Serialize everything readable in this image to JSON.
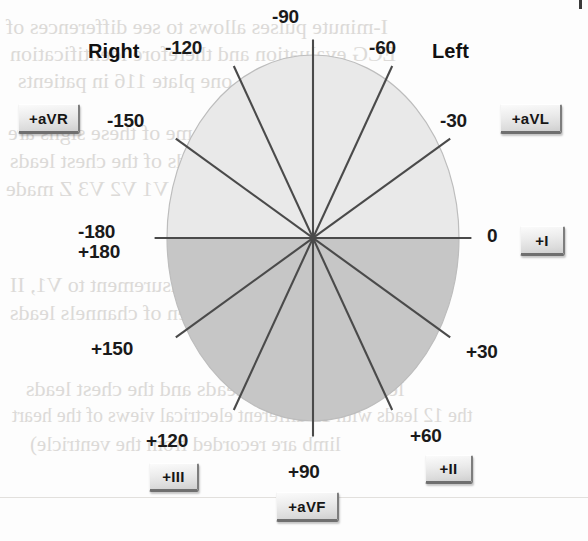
{
  "diagram": {
    "title_semantic": "hexaxial-reference-system",
    "center": {
      "x": 313,
      "y": 238
    },
    "radius_x": 146,
    "radius_y": 183,
    "colors": {
      "upper_half_fill": "#e9e9e9",
      "lower_half_fill": "#c6c6c6",
      "axis_line": "#4a4a4a",
      "circle_edge": "#bdbdbd",
      "label_text": "#1a1a1a",
      "button_face": "#e8e8e8",
      "page_background": "#fdfdfd"
    },
    "headings": {
      "right": "Right",
      "left": "Left"
    },
    "degree_labels": [
      {
        "name": "minus-90",
        "text": "-90",
        "x": 272,
        "y": 6,
        "angle": -90
      },
      {
        "name": "minus-60",
        "text": "-60",
        "x": 369,
        "y": 37,
        "angle": -60
      },
      {
        "name": "minus-30",
        "text": "-30",
        "x": 440,
        "y": 110,
        "angle": -30
      },
      {
        "name": "zero",
        "text": "0",
        "x": 487,
        "y": 225,
        "angle": 0
      },
      {
        "name": "plus-30",
        "text": "+30",
        "x": 466,
        "y": 341,
        "angle": 30
      },
      {
        "name": "plus-60",
        "text": "+60",
        "x": 410,
        "y": 425,
        "angle": 60
      },
      {
        "name": "plus-90",
        "text": "+90",
        "x": 288,
        "y": 461,
        "angle": 90
      },
      {
        "name": "plus-120",
        "text": "+120",
        "x": 146,
        "y": 430,
        "angle": 120
      },
      {
        "name": "plus-150",
        "text": "+150",
        "x": 91,
        "y": 338,
        "angle": 150
      },
      {
        "name": "plus-minus-180-line1",
        "text": "-180",
        "x": 78,
        "y": 221,
        "angle": 180
      },
      {
        "name": "plus-minus-180-line2",
        "text": "+180",
        "x": 78,
        "y": 241,
        "angle": 180
      },
      {
        "name": "minus-150",
        "text": "-150",
        "x": 107,
        "y": 110,
        "angle": -150
      },
      {
        "name": "minus-120",
        "text": "-120",
        "x": 165,
        "y": 37,
        "angle": -120
      }
    ],
    "lead_buttons": [
      {
        "name": "lead-aVR",
        "label": "+aVR",
        "x": 18,
        "y": 104,
        "w": 62,
        "h": 30
      },
      {
        "name": "lead-aVL",
        "label": "+aVL",
        "x": 500,
        "y": 104,
        "w": 62,
        "h": 30
      },
      {
        "name": "lead-I",
        "label": "+I",
        "x": 520,
        "y": 226,
        "w": 45,
        "h": 30
      },
      {
        "name": "lead-II",
        "label": "+II",
        "x": 425,
        "y": 455,
        "w": 48,
        "h": 29
      },
      {
        "name": "lead-aVF",
        "label": "+aVF",
        "x": 276,
        "y": 492,
        "w": 63,
        "h": 30
      },
      {
        "name": "lead-III",
        "label": "+III",
        "x": 149,
        "y": 463,
        "w": 50,
        "h": 29
      }
    ],
    "ghost_text": [
      {
        "text": "I-minute pulses allows to see differences of",
        "x": 6,
        "y": 14,
        "size": 22
      },
      {
        "text": "ECG evaluation and therefore identification",
        "x": 10,
        "y": 41,
        "size": 22
      },
      {
        "text": "one plate 116 in patients",
        "x": 18,
        "y": 68,
        "size": 22
      },
      {
        "text": "tuous particular. Some of these signs are",
        "x": 8,
        "y": 120,
        "size": 22
      },
      {
        "text": "sured on  these leads of the chest leads",
        "x": 10,
        "y": 148,
        "size": 22
      },
      {
        "text": "pulse unipolar leads as V1 V2 V3 Z made",
        "x": 6,
        "y": 176,
        "size": 22
      },
      {
        "text": "2) the artifact  measurement to V1, II",
        "x": 10,
        "y": 272,
        "size": 22
      },
      {
        "text": "to  pulse has been of  channels leads",
        "x": 10,
        "y": 300,
        "size": 22
      },
      {
        "text": "Tip 3   12-lead ECG, I",
        "x": 212,
        "y": 348,
        "size": 22
      },
      {
        "text": "leads the unipolar leads  and the chest leads",
        "x": 26,
        "y": 376,
        "size": 22
      },
      {
        "text": "the 12 leads with 12 different electrical views of the heart",
        "x": 12,
        "y": 404,
        "size": 20
      },
      {
        "text": "limb are  recorded  from the  ventricle)",
        "x": 30,
        "y": 432,
        "size": 21
      }
    ]
  }
}
